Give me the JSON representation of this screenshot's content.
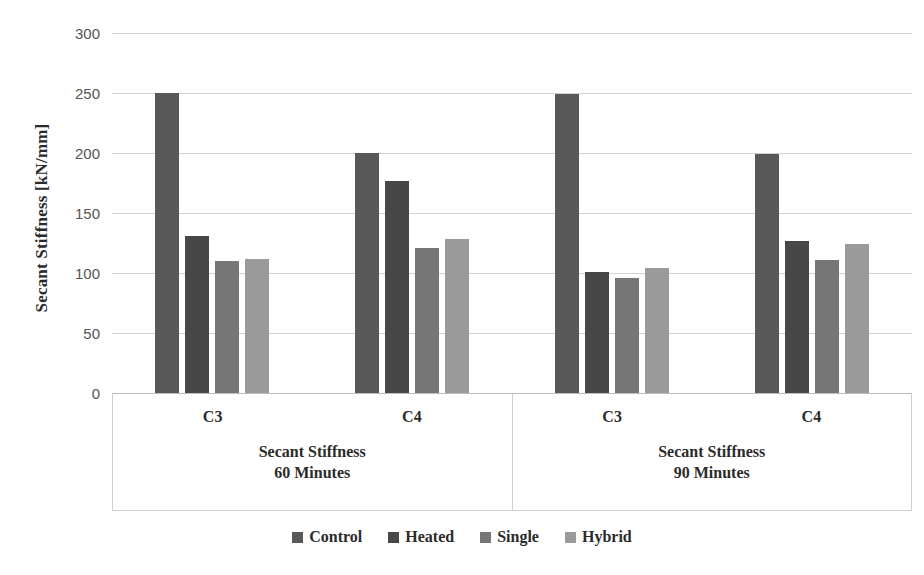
{
  "chart_data": {
    "type": "bar",
    "title": "",
    "xlabel": "",
    "ylabel": "Secant Stiffness [kN/mm]",
    "ylim": [
      0,
      300
    ],
    "ytick_step": 50,
    "yticks": [
      300,
      250,
      200,
      150,
      100,
      50,
      0
    ],
    "grid": true,
    "legend_position": "bottom",
    "group_axis": {
      "outer_groups": [
        {
          "label_line1": "Secant Stiffness",
          "label_line2": "60 Minutes",
          "categories": [
            "C3",
            "C4"
          ]
        },
        {
          "label_line1": "Secant Stiffness",
          "label_line2": "90 Minutes",
          "categories": [
            "C3",
            "C4"
          ]
        }
      ]
    },
    "categories": [
      "Secant Stiffness 60 Minutes - C3",
      "Secant Stiffness 60 Minutes - C4",
      "Secant Stiffness 90 Minutes - C3",
      "Secant Stiffness 90 Minutes - C4"
    ],
    "series": [
      {
        "name": "Control",
        "color": "#585858",
        "values": [
          250,
          200,
          249,
          199
        ]
      },
      {
        "name": "Heated",
        "color": "#474747",
        "values": [
          131,
          177,
          101,
          127
        ]
      },
      {
        "name": "Single",
        "color": "#767676",
        "values": [
          110,
          121,
          96,
          111
        ]
      },
      {
        "name": "Hybrid",
        "color": "#9a9a9a",
        "values": [
          112,
          128,
          104,
          124
        ]
      }
    ]
  },
  "legend": {
    "items": [
      {
        "label": "Control",
        "color": "#585858"
      },
      {
        "label": "Heated",
        "color": "#474747"
      },
      {
        "label": "Single",
        "color": "#767676"
      },
      {
        "label": "Hybrid",
        "color": "#9a9a9a"
      }
    ]
  },
  "colors": {
    "background": "#ffffff",
    "gridline": "#d2d2d2",
    "axis_border": "#cfcfcf",
    "text": "#2b2b2b",
    "tick_text": "#555555"
  }
}
